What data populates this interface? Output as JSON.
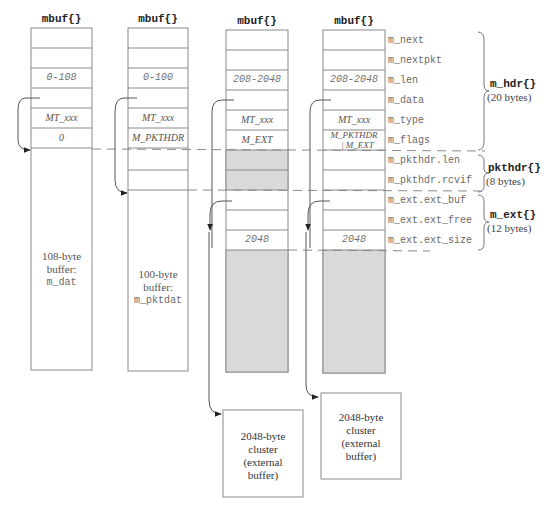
{
  "mbufs": [
    {
      "header": "mbuf{}",
      "len": "0-108",
      "type": "MT_xxx",
      "flags": "0",
      "buffer_label": [
        "108-byte",
        "buffer:",
        "m_dat"
      ]
    },
    {
      "header": "mbuf{}",
      "len": "0-100",
      "type": "MT_xxx",
      "flags": "M_PKTHDR",
      "buffer_label": [
        "100-byte",
        "buffer:",
        "m_pktdat"
      ]
    },
    {
      "header": "mbuf{}",
      "len": "208-2048",
      "type": "MT_xxx",
      "flags": "M_EXT",
      "ext_size": "2048"
    },
    {
      "header": "mbuf{}",
      "len": "208-2048",
      "type": "MT_xxx",
      "flags_line1": "M_PKTHDR",
      "flags_line2": "| M_EXT",
      "ext_size": "2048"
    }
  ],
  "fields": [
    "m_next",
    "m_nextpkt",
    "m_len",
    "m_data",
    "m_type",
    "m_flags",
    "m_pkthdr.len",
    "m_pkthdr.rcvif",
    "m_ext.ext_buf",
    "m_ext.ext_free",
    "m_ext.ext_size"
  ],
  "groups": [
    {
      "name": "m_hdr{}",
      "size": "(20 bytes)"
    },
    {
      "name": "pkthdr{}",
      "size": "(8 bytes)"
    },
    {
      "name": "m_ext{}",
      "size": "(12 bytes)"
    }
  ],
  "clusters": [
    {
      "label": [
        "2048-byte",
        "cluster",
        "(external",
        "buffer)"
      ]
    },
    {
      "label": [
        "2048-byte",
        "cluster",
        "(external",
        "buffer)"
      ]
    }
  ],
  "colors": {
    "line": "#8a8a8a",
    "shade": "#d9d9d9",
    "text": "#6a6a6a"
  }
}
